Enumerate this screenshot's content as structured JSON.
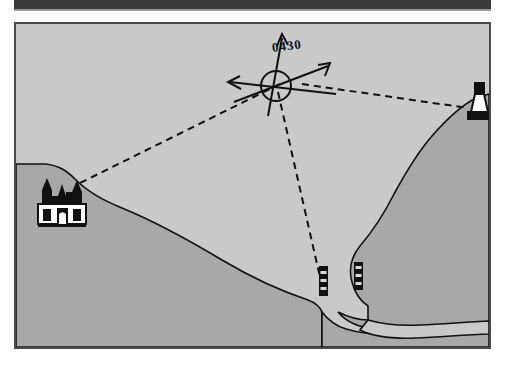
{
  "document": {
    "type": "nautical-chart-sketch",
    "title": "Coastal bearing fix sketch",
    "background_color": "#ffffff",
    "top_bar_color": "#3a3a3a"
  },
  "map": {
    "frame_color": "#4a4a4a",
    "sea_color": "#c9c9c9",
    "land_color": "#a8a8a8",
    "ink_color": "#111111",
    "fix_label": "0430",
    "landmarks": [
      {
        "name": "church",
        "label": "church-symbol",
        "x": 44,
        "y": 188
      },
      {
        "name": "lighthouse",
        "label": "lighthouse-symbol",
        "x": 472,
        "y": 103
      },
      {
        "name": "beacon-west",
        "label": "beacon-tower-symbol",
        "x": 318,
        "y": 288
      },
      {
        "name": "beacon-east",
        "label": "beacon-tower-symbol",
        "x": 353,
        "y": 283
      }
    ],
    "fix_position": {
      "x": 272,
      "y": 75
    },
    "compass_radius": 15,
    "bearing_lines": [
      {
        "name": "bearing-to-church",
        "from": "fix",
        "to": "church"
      },
      {
        "name": "bearing-to-lighthouse",
        "from": "fix",
        "to": "lighthouse"
      },
      {
        "name": "bearing-to-beacon",
        "from": "fix",
        "to": "beacon-west"
      }
    ],
    "compass_arrows": [
      {
        "name": "north-arrow",
        "direction": "up"
      },
      {
        "name": "west-arrow",
        "direction": "left"
      },
      {
        "name": "course-arrow",
        "direction": "up-right"
      }
    ]
  }
}
